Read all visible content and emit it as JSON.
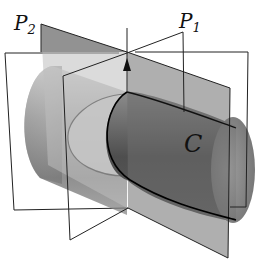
{
  "figure": {
    "labels": {
      "plane_2": {
        "main": "P",
        "sub": "2"
      },
      "plane_1": {
        "main": "P",
        "sub": "1"
      },
      "curve": "C"
    },
    "colors": {
      "plane_p2_fill": "#6e6e6e",
      "plane_outline": "#222222",
      "cylinder_light": "#d8d8d8",
      "cylinder_dark": "#4a4a4a",
      "curve_stroke": "#000000",
      "background": "#ffffff"
    }
  }
}
